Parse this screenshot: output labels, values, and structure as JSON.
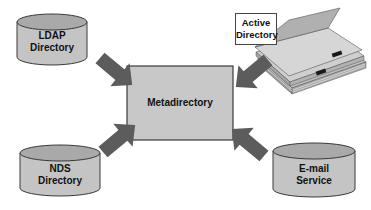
{
  "diagram": {
    "center": {
      "label": "Metadirectory"
    },
    "sources": [
      {
        "id": "ldap",
        "line1": "LDAP",
        "line2": "Directory",
        "shape": "cylinder"
      },
      {
        "id": "active-directory",
        "line1": "Active",
        "line2": "Directory",
        "shape": "book"
      },
      {
        "id": "nds",
        "line1": "NDS",
        "line2": "Directory",
        "shape": "cylinder"
      },
      {
        "id": "email",
        "line1": "E-mail",
        "line2": "Service",
        "shape": "cylinder"
      }
    ],
    "colors": {
      "shape_fill": "#c4c4c4",
      "shape_top": "#a9a9a9",
      "outline": "#3a3a3a",
      "arrow": "#5c5c5c",
      "book_page": "#d2d2d2",
      "tab": "#1a1a1a"
    }
  }
}
